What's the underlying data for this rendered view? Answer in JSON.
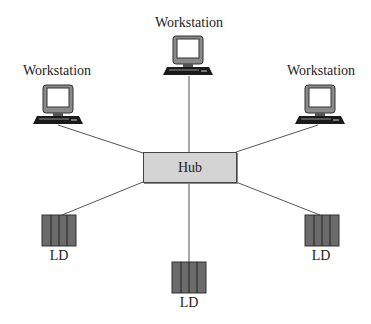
{
  "diagram": {
    "type": "star-topology-network",
    "hub": {
      "label": "Hub",
      "fill": "#d4d4d4"
    },
    "workstations": [
      {
        "id": "top",
        "label": "Workstation"
      },
      {
        "id": "left",
        "label": "Workstation"
      },
      {
        "id": "right",
        "label": "Workstation"
      }
    ],
    "devices": [
      {
        "id": "left",
        "label": "LD"
      },
      {
        "id": "middle",
        "label": "LD"
      },
      {
        "id": "right",
        "label": "LD"
      }
    ],
    "colors": {
      "line": "#555555",
      "device_fill": "#6b6b6b",
      "monitor_frame": "#7a7a7a",
      "keyboard": "#1a1a1a"
    }
  }
}
